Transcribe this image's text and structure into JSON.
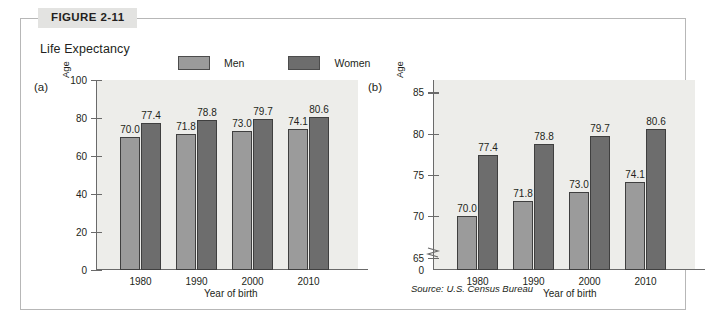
{
  "figure": {
    "tag": "FIGURE 2-11",
    "title": "Life Expectancy",
    "source": "Source: U.S. Census Bureau"
  },
  "legend": {
    "items": [
      {
        "label": "Men",
        "color": "#9b9b9b",
        "name": "men"
      },
      {
        "label": "Women",
        "color": "#6d6d6d",
        "name": "women"
      }
    ]
  },
  "panels": {
    "a": {
      "letter": "(a)"
    },
    "b": {
      "letter": "(b)"
    }
  },
  "chart_data": [
    {
      "type": "bar",
      "panel": "(a)",
      "title": "Life Expectancy",
      "xlabel": "Year of birth",
      "ylabel": "Age",
      "categories": [
        "1980",
        "1990",
        "2000",
        "2010"
      ],
      "series": [
        {
          "name": "Men",
          "values": [
            70.0,
            71.8,
            73.0,
            74.1
          ],
          "color": "#9b9b9b"
        },
        {
          "name": "Women",
          "values": [
            77.4,
            78.8,
            79.7,
            80.6
          ],
          "color": "#6d6d6d"
        }
      ],
      "value_labels": [
        [
          "70.0",
          "71.8",
          "73.0",
          "74.1"
        ],
        [
          "77.4",
          "78.8",
          "79.7",
          "80.6"
        ]
      ],
      "ylim": [
        0,
        100
      ],
      "yticks": [
        0,
        20,
        40,
        60,
        80,
        100
      ],
      "ytick_labels": [
        "0",
        "20",
        "40",
        "60",
        "80",
        "100"
      ],
      "axis_break": false,
      "grid": false,
      "legend_position": "top"
    },
    {
      "type": "bar",
      "panel": "(b)",
      "title": "Life Expectancy",
      "xlabel": "Year of birth",
      "ylabel": "Age",
      "categories": [
        "1980",
        "1990",
        "2000",
        "2010"
      ],
      "series": [
        {
          "name": "Men",
          "values": [
            70.0,
            71.8,
            73.0,
            74.1
          ],
          "color": "#9b9b9b"
        },
        {
          "name": "Women",
          "values": [
            77.4,
            78.8,
            79.7,
            80.6
          ],
          "color": "#6d6d6d"
        }
      ],
      "value_labels": [
        [
          "70.0",
          "71.8",
          "73.0",
          "74.1"
        ],
        [
          "77.4",
          "78.8",
          "79.7",
          "80.6"
        ]
      ],
      "ylim": [
        63.5,
        86.5
      ],
      "yticks": [
        65,
        70,
        75,
        80,
        85
      ],
      "ytick_labels": [
        "65",
        "70",
        "75",
        "80",
        "85"
      ],
      "zero_label": "0",
      "axis_break": true,
      "grid": false,
      "legend_position": "top"
    }
  ]
}
